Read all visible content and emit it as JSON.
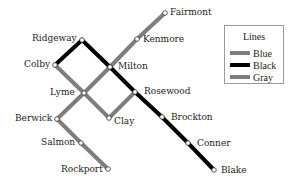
{
  "legend": {
    "title": "Lines",
    "items": [
      {
        "label": "Blue",
        "color": "#7d7d7d"
      },
      {
        "label": "Black",
        "color": "#000000"
      },
      {
        "label": "Gray",
        "color": "#7d7d7d"
      }
    ]
  },
  "stations": {
    "fairmont": {
      "name": "Fairmont",
      "x": 165,
      "y": 13
    },
    "kenmore": {
      "name": "Kenmore",
      "x": 137,
      "y": 39
    },
    "ridgeway": {
      "name": "Ridgeway",
      "x": 82,
      "y": 40
    },
    "colby": {
      "name": "Colby",
      "x": 55,
      "y": 65
    },
    "milton": {
      "name": "Milton",
      "x": 110,
      "y": 67
    },
    "lyme": {
      "name": "Lyme",
      "x": 84,
      "y": 93
    },
    "rosewood": {
      "name": "Rosewood",
      "x": 135,
      "y": 92
    },
    "berwick": {
      "name": "Berwick",
      "x": 57,
      "y": 119
    },
    "clay": {
      "name": "Clay",
      "x": 109,
      "y": 118
    },
    "brockton": {
      "name": "Brockton",
      "x": 162,
      "y": 117
    },
    "salmon": {
      "name": "Salmon",
      "x": 81,
      "y": 143
    },
    "conner": {
      "name": "Conner",
      "x": 188,
      "y": 143
    },
    "rockport": {
      "name": "Rockport",
      "x": 108,
      "y": 169
    },
    "blake": {
      "name": "Blake",
      "x": 214,
      "y": 170
    }
  },
  "lines": [
    {
      "name": "Blue",
      "color": "#7d7d7d",
      "stops": [
        "fairmont",
        "kenmore",
        "milton",
        "lyme",
        "berwick",
        "salmon",
        "rockport"
      ]
    },
    {
      "name": "Gray",
      "color": "#7d7d7d",
      "stops": [
        "colby",
        "lyme",
        "clay",
        "rosewood"
      ]
    },
    {
      "name": "Black",
      "color": "#000000",
      "stops": [
        "colby",
        "ridgeway",
        "milton",
        "rosewood",
        "brockton",
        "conner",
        "blake"
      ]
    }
  ]
}
